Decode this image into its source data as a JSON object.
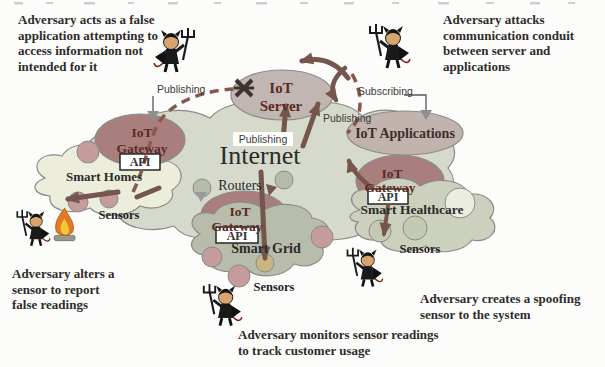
{
  "annotations": {
    "top_left": "Adversary acts as a false application attempting to access information not intended for it",
    "top_right": "Adversary attacks communication conduit between server and applications",
    "bottom_left": "Adversary alters a sensor to report false readings",
    "bottom_center": "Adversary monitors sensor readings to track customer usage",
    "bottom_right": "Adversary creates a spoofing sensor to the system"
  },
  "nodes": {
    "internet": {
      "label": "Internet"
    },
    "routers": {
      "label": "Routers"
    },
    "iot_server": {
      "line1": "IoT",
      "line2": "Server"
    },
    "iot_applications": {
      "label": "IoT Applications"
    },
    "gateway_left": {
      "line1": "IoT",
      "line2": "Gateway",
      "api": "API"
    },
    "gateway_center": {
      "line1": "IoT",
      "line2": "Gateway",
      "api": "API"
    },
    "gateway_right": {
      "line1": "IoT",
      "line2": "Gateway",
      "api": "API"
    },
    "smart_homes": {
      "label": "Smart Homes",
      "sensors": "Sensors"
    },
    "smart_grid": {
      "label": "Smart Grid",
      "sensors": "Sensors"
    },
    "smart_healthcare": {
      "label": "Smart Healthcare",
      "sensors": "Sensors"
    }
  },
  "edges": {
    "publishing_left": "Publishing",
    "publishing_center": "Publishing",
    "publishing_right": "Publishing",
    "subscribing": "Subscribing"
  },
  "icons": {
    "adversary": "devil-with-trident",
    "sensor_tamper": "flame",
    "attack_point": "x-burst"
  },
  "colors": {
    "internet_cloud": "#d6dacc",
    "smart_homes_cloud": "#eceedb",
    "smart_grid_cloud": "#b7bdaa",
    "smart_healthcare_cloud": "#cbd1bd",
    "gateway_ellipse": "#a97f7e",
    "server_ellipse": "#c2b6b2",
    "applications_ellipse": "#c1b3ae",
    "sensor_circle": "#c49c9c",
    "router_circle": "#b5bca9",
    "arrow": "#75564c",
    "dashed_arrow": "#86584e"
  }
}
